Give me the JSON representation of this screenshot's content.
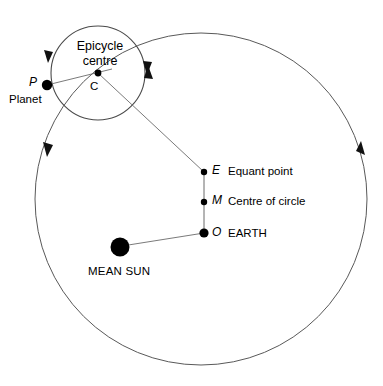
{
  "diagram": {
    "colors": {
      "stroke": "#555555",
      "point": "#000000",
      "background": "#ffffff"
    },
    "labels": {
      "epicycle_centre_line1": "Epicycle",
      "epicycle_centre_line2": "centre",
      "c_point": "C",
      "p_point": "P",
      "planet": "Planet",
      "e_point": "E",
      "equant_point": "Equant point",
      "m_point": "M",
      "centre_of_circle": "Centre of circle",
      "o_point": "O",
      "earth": "EARTH",
      "mean_sun": "MEAN SUN"
    },
    "geometry": {
      "deferent": {
        "cx": 201,
        "cy": 199,
        "r": 166
      },
      "epicycle": {
        "cx": 98,
        "cy": 73,
        "r": 47
      },
      "points": {
        "P": {
          "x": 47,
          "y": 85,
          "r": 5.2
        },
        "C": {
          "x": 98,
          "y": 73,
          "r": 3.4
        },
        "E": {
          "x": 204,
          "y": 172,
          "r": 3.2
        },
        "M": {
          "x": 204,
          "y": 202,
          "r": 3.2
        },
        "O": {
          "x": 204,
          "y": 233,
          "r": 4.6
        },
        "MEAN_SUN": {
          "x": 120,
          "y": 247,
          "r": 9.5
        }
      },
      "arrowheads": [
        {
          "name": "epicycle-left-arrow",
          "x": 48,
          "y": 57,
          "dir": "down"
        },
        {
          "name": "epicycle-right-arrow",
          "x": 147,
          "y": 69,
          "dir": "down"
        },
        {
          "name": "deferent-upper-right-arrow",
          "x": 148,
          "y": 74,
          "dir": "up"
        },
        {
          "name": "deferent-left-arrow",
          "x": 48,
          "y": 149,
          "dir": "down"
        },
        {
          "name": "deferent-right-arrow",
          "x": 360,
          "y": 148,
          "dir": "up"
        }
      ]
    }
  }
}
